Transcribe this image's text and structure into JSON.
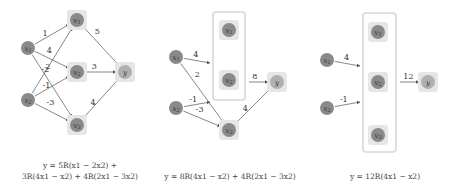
{
  "colors": {
    "node_fill": "#8a8a8a",
    "node_halo": "#e6e6e6",
    "output_fill": "#b0b0b0",
    "edge": "#555555",
    "box": "#d8d8d8"
  },
  "panels": [
    {
      "id": "panel-1",
      "nodes": [
        {
          "id": "x1",
          "label": "x1",
          "x": 28,
          "y": 48,
          "type": "input"
        },
        {
          "id": "x2",
          "label": "x2",
          "x": 28,
          "y": 100,
          "type": "input"
        },
        {
          "id": "v1",
          "label": "v1",
          "x": 77,
          "y": 20,
          "type": "hidden"
        },
        {
          "id": "v2",
          "label": "v2",
          "x": 77,
          "y": 72,
          "type": "hidden"
        },
        {
          "id": "v3",
          "label": "v3",
          "x": 77,
          "y": 125,
          "type": "hidden"
        },
        {
          "id": "y",
          "label": "y",
          "x": 125,
          "y": 72,
          "type": "output"
        }
      ],
      "edges": [
        {
          "from": "x1",
          "to": "v1",
          "weight": "1"
        },
        {
          "from": "x1",
          "to": "v2",
          "weight": "4"
        },
        {
          "from": "x1",
          "to": "v3",
          "weight": "2"
        },
        {
          "from": "x2",
          "to": "v1",
          "weight": "-2"
        },
        {
          "from": "x2",
          "to": "v2",
          "weight": "-1"
        },
        {
          "from": "x2",
          "to": "v3",
          "weight": "-3"
        },
        {
          "from": "v1",
          "to": "y",
          "weight": "5"
        },
        {
          "from": "v2",
          "to": "y",
          "weight": "3"
        },
        {
          "from": "v3",
          "to": "y",
          "weight": "4"
        }
      ],
      "caption_lines": [
        "y  =  5R(x1 − 2x2) +",
        "3R(4x1 − x2) + 4R(2x1 − 3x2)"
      ]
    },
    {
      "id": "panel-2",
      "nodes": [
        {
          "id": "x1",
          "label": "x1",
          "x": 176,
          "y": 57,
          "type": "input"
        },
        {
          "id": "x2",
          "label": "x2",
          "x": 176,
          "y": 108,
          "type": "input"
        },
        {
          "id": "v1",
          "label": "v1",
          "x": 229,
          "y": 30,
          "type": "hidden"
        },
        {
          "id": "v2",
          "label": "v2",
          "x": 229,
          "y": 80,
          "type": "hidden"
        },
        {
          "id": "v3",
          "label": "v3",
          "x": 229,
          "y": 130,
          "type": "hidden"
        },
        {
          "id": "y",
          "label": "y",
          "x": 277,
          "y": 82,
          "type": "output"
        }
      ],
      "group_box": {
        "x": 213,
        "y": 12,
        "w": 32,
        "h": 88
      },
      "edges": [
        {
          "from": "x1",
          "to": "box",
          "weight": "4"
        },
        {
          "from": "x1",
          "to": "v3",
          "weight": "2"
        },
        {
          "from": "x2",
          "to": "box",
          "weight": "-1"
        },
        {
          "from": "x2",
          "to": "v3",
          "weight": "-3"
        },
        {
          "from": "box",
          "to": "y",
          "weight": "8"
        },
        {
          "from": "v3",
          "to": "y",
          "weight": "4"
        }
      ],
      "caption_lines": [
        "y = 8R(4x1 − x2) + 4R(2x1 − 3x2)"
      ]
    },
    {
      "id": "panel-3",
      "nodes": [
        {
          "id": "x1",
          "label": "x1",
          "x": 327,
          "y": 60,
          "type": "input"
        },
        {
          "id": "x2",
          "label": "x2",
          "x": 327,
          "y": 108,
          "type": "input"
        },
        {
          "id": "v1",
          "label": "v1",
          "x": 378,
          "y": 32,
          "type": "hidden"
        },
        {
          "id": "v2",
          "label": "v2",
          "x": 378,
          "y": 82,
          "type": "hidden"
        },
        {
          "id": "v3",
          "label": "v3",
          "x": 378,
          "y": 135,
          "type": "hidden"
        },
        {
          "id": "y",
          "label": "y",
          "x": 428,
          "y": 82,
          "type": "output"
        }
      ],
      "group_box": {
        "x": 363,
        "y": 13,
        "w": 33,
        "h": 139
      },
      "edges": [
        {
          "from": "x1",
          "to": "box",
          "weight": "4"
        },
        {
          "from": "x2",
          "to": "box",
          "weight": "-1"
        },
        {
          "from": "box",
          "to": "y",
          "weight": "12"
        }
      ],
      "caption_lines": [
        "y  =  12R(4x1 − x2)"
      ]
    }
  ]
}
